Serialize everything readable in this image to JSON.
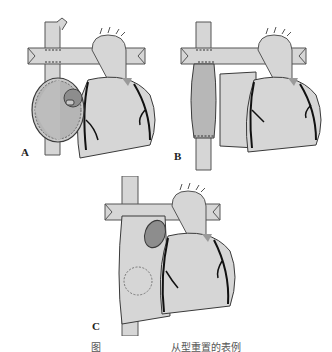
{
  "figure": {
    "panels": [
      {
        "id": "A",
        "label": "A",
        "description": "Heart with opened right atrium showing interior and septal defect, aorta and superior vena cava with suture lines"
      },
      {
        "id": "B",
        "label": "B",
        "description": "Heart with reconstructed superior vena cava conduit and closed atrium"
      },
      {
        "id": "C",
        "label": "C",
        "description": "Heart with oval patch on right atrium and dashed circle outline"
      }
    ],
    "caption": {
      "left": "图",
      "right": "从型重置的表例"
    },
    "colors": {
      "tissue": "#d6d6d6",
      "tissue_dark": "#9a9a9a",
      "outline": "#3a3a3a",
      "vessel_line": "#111111",
      "background": "#ffffff"
    }
  }
}
